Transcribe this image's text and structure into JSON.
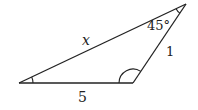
{
  "diagram": {
    "type": "triangle",
    "stroke_color": "#222222",
    "background": "#ffffff",
    "vertices": {
      "left": {
        "x": 19,
        "y": 83
      },
      "bottom_right": {
        "x": 133,
        "y": 83
      },
      "top": {
        "x": 186,
        "y": 4
      }
    },
    "sides": {
      "hypotenuse_label": "x",
      "right_side_label": "1",
      "bottom_side_label": "5"
    },
    "angles": {
      "top_angle_label": "45°",
      "top_angle_marked": true,
      "left_angle_marked": true,
      "bottom_right_angle_marked": true
    }
  }
}
